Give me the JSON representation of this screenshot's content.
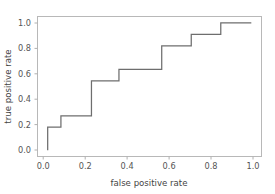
{
  "chart_data": {
    "type": "line",
    "title": "",
    "xlabel": "false positive rate",
    "ylabel": "true positive rate",
    "xlim": [
      -0.05,
      1.05
    ],
    "ylim": [
      -0.05,
      1.05
    ],
    "grid": false,
    "legend": null,
    "xticks": [
      0.0,
      0.2,
      0.4,
      0.6,
      0.8,
      1.0
    ],
    "xticklabels": [
      "0.0",
      "0.2",
      "0.4",
      "0.6",
      "0.8",
      "1.0"
    ],
    "yticks": [
      0.0,
      0.2,
      0.4,
      0.6,
      0.8,
      1.0
    ],
    "yticklabels": [
      "0.0",
      "0.2",
      "0.4",
      "0.6",
      "0.8",
      "1.0"
    ],
    "drawstyle": "steps-post",
    "line_color": "#6e6e6e",
    "series": [
      {
        "name": "ROC curve",
        "x": [
          0.0,
          0.0,
          0.065,
          0.065,
          0.215,
          0.215,
          0.35,
          0.35,
          0.56,
          0.56,
          0.705,
          0.705,
          0.85,
          0.85,
          1.0
        ],
        "y": [
          0.0,
          0.18,
          0.18,
          0.27,
          0.27,
          0.545,
          0.545,
          0.635,
          0.635,
          0.82,
          0.82,
          0.91,
          0.91,
          1.0,
          1.0
        ]
      }
    ]
  },
  "axis_labels": {
    "x": "false positive rate",
    "y": "true positive rate"
  },
  "ticks": {
    "x": [
      "0.0",
      "0.2",
      "0.4",
      "0.6",
      "0.8",
      "1.0"
    ],
    "y": [
      "0.0",
      "0.2",
      "0.4",
      "0.6",
      "0.8",
      "1.0"
    ]
  },
  "colors": {
    "line": "#6e6e6e",
    "spine": "#b8b8b8",
    "tick_text": "#555555",
    "background": "#ffffff"
  }
}
